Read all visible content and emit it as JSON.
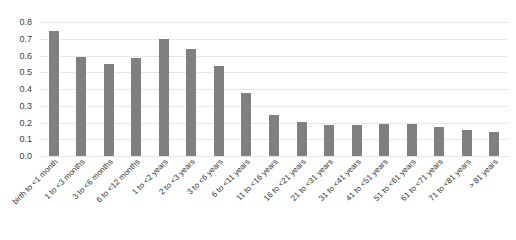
{
  "chart_data": {
    "type": "bar",
    "title": "",
    "xlabel": "",
    "ylabel": "",
    "ylim": [
      0,
      0.8
    ],
    "y_ticks": [
      "0.0",
      "0.1",
      "0.2",
      "0.3",
      "0.4",
      "0.5",
      "0.6",
      "0.7",
      "0.8"
    ],
    "y_tick_values": [
      0.0,
      0.1,
      0.2,
      0.3,
      0.4,
      0.5,
      0.6,
      0.7,
      0.8
    ],
    "grid": true,
    "legend": false,
    "bar_color": "#808080",
    "gridline_color": "#e8e8ec",
    "categories": [
      "birth to <1 month",
      "1 to <3 months",
      "3 to <6 months",
      "6 to <12 months",
      "1 to <2 years",
      "2 to <3 years",
      "3 to <6 years",
      "6 to <11 years",
      "11 to <16 years",
      "16 to <21 years",
      "21 to <31 years",
      "31 to <41 years",
      "41 to <51 years",
      "51 to <61 years",
      "61 to <71 years",
      "71 to <81 years",
      "> 81 years"
    ],
    "values": [
      0.745,
      0.59,
      0.55,
      0.585,
      0.7,
      0.64,
      0.54,
      0.375,
      0.245,
      0.205,
      0.185,
      0.185,
      0.19,
      0.19,
      0.175,
      0.155,
      0.145
    ]
  }
}
